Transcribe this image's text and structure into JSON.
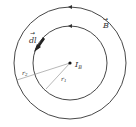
{
  "diagram": {
    "labels": {
      "dl": "dl",
      "B": "B",
      "current": "I",
      "current_sub": "B",
      "r1": "r",
      "r1_sub": "1",
      "r2": "r",
      "r2_sub": "2"
    },
    "geometry": {
      "center": [
        70,
        63
      ],
      "inner_radius": 37,
      "outer_radius": 56
    },
    "colors": {
      "stroke": "#333333",
      "radius_line": "#999999",
      "background": "#ffffff"
    }
  }
}
